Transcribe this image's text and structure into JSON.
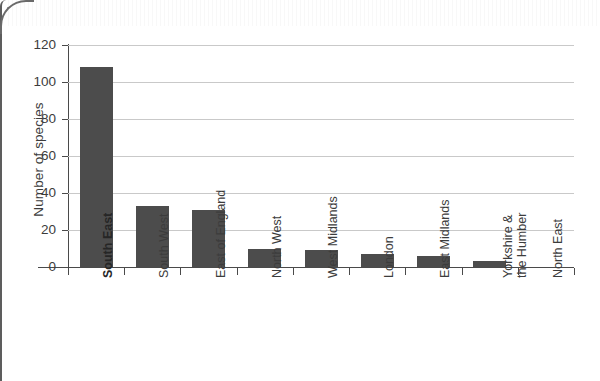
{
  "chart_data": {
    "type": "bar",
    "title": "",
    "xlabel": "",
    "ylabel": "Number of species",
    "ylim": [
      0,
      120
    ],
    "ytick_interval": 20,
    "ytick_labels": [
      "120",
      "100",
      "80",
      "60",
      "40",
      "20",
      "0"
    ],
    "ytick_values": [
      120,
      100,
      80,
      60,
      40,
      20,
      0
    ],
    "grid": "horizontal",
    "legend": "none",
    "bar_color": "#4c4c4c",
    "gridline_color": "#c9c9c9",
    "axis_color": "#4a4a4a",
    "categories": [
      "South East",
      "South West",
      "East of England",
      "North West",
      "West Midlands",
      "London",
      "East Midlands",
      "Yorkshire &\nthe Humber",
      "North East"
    ],
    "values": [
      108,
      33,
      31,
      10,
      9,
      7,
      6,
      3,
      0
    ],
    "highlighted_category": "South East"
  }
}
